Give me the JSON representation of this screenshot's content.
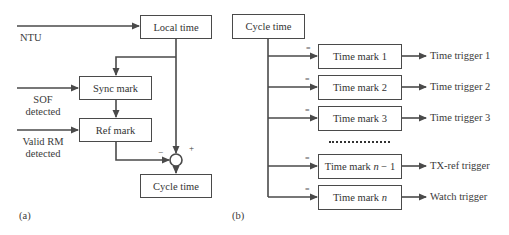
{
  "panel_a": {
    "caption": "(a)",
    "inputs": {
      "ntu": "NTU",
      "sof_line1": "SOF",
      "sof_line2": "detected",
      "rm_line1": "Valid RM",
      "rm_line2": "detected"
    },
    "blocks": {
      "local_time": "Local time",
      "sync_mark": "Sync mark",
      "ref_mark": "Ref mark",
      "cycle_time": "Cycle time"
    },
    "junction": {
      "minus_sign": "−",
      "plus_sign": "+"
    }
  },
  "panel_b": {
    "caption": "(b)",
    "source_block": "Cycle time",
    "comparator_symbol": "=",
    "ellipsis": "..................",
    "rows": [
      {
        "mark": "Time mark 1",
        "trigger": "Time trigger 1"
      },
      {
        "mark": "Time mark 2",
        "trigger": "Time trigger 2"
      },
      {
        "mark": "Time mark 3",
        "trigger": "Time trigger 3"
      },
      {
        "mark_prefix": "Time mark ",
        "mark_var": "n",
        "mark_suffix": " − 1",
        "trigger": "TX-ref trigger"
      },
      {
        "mark_prefix": "Time mark ",
        "mark_var": "n",
        "mark_suffix": "",
        "trigger": "Watch trigger"
      }
    ]
  },
  "colors": {
    "line": "#4a4a4a",
    "text": "#333333",
    "background": "#ffffff"
  }
}
